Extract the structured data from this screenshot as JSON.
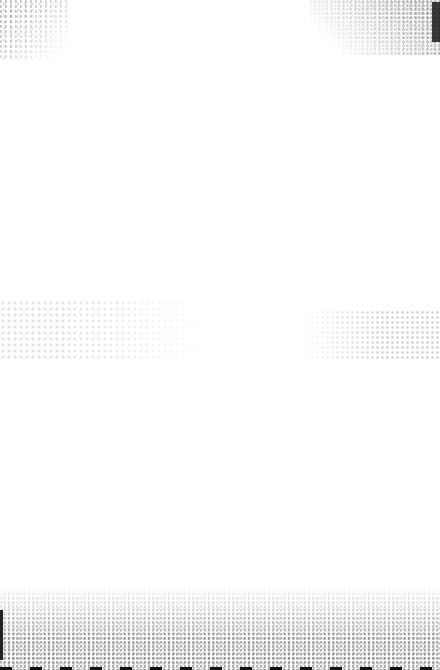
{
  "document": {
    "type": "blank scanned page",
    "text_content": []
  }
}
